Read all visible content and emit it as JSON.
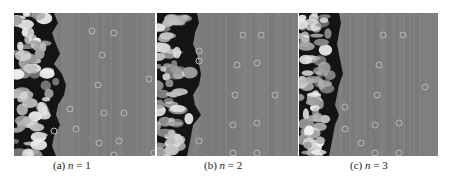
{
  "figure": {
    "panels": [
      {
        "id": "a",
        "label": "(a)",
        "var": "n",
        "eq": " = ",
        "value": "1",
        "boundary": [
          40,
          44,
          38,
          42,
          46,
          40,
          48,
          52,
          50,
          44,
          42,
          46,
          40,
          38,
          42
        ],
        "dots": [
          [
            78,
            18
          ],
          [
            100,
            20
          ],
          [
            88,
            42
          ],
          [
            135,
            66
          ],
          [
            84,
            72
          ],
          [
            56,
            96
          ],
          [
            90,
            100
          ],
          [
            110,
            100
          ],
          [
            62,
            116
          ],
          [
            85,
            130
          ],
          [
            105,
            128
          ],
          [
            140,
            140
          ],
          [
            100,
            142
          ],
          [
            40,
            118
          ]
        ]
      },
      {
        "id": "b",
        "label": "(b)",
        "var": "n",
        "eq": " = ",
        "value": "2",
        "boundary": [
          40,
          42,
          38,
          36,
          40,
          42,
          44,
          42,
          36,
          38,
          44,
          36,
          34,
          32,
          30
        ],
        "dots": [
          [
            86,
            22
          ],
          [
            104,
            22
          ],
          [
            80,
            52
          ],
          [
            100,
            50
          ],
          [
            78,
            82
          ],
          [
            118,
            82
          ],
          [
            76,
            112
          ],
          [
            100,
            110
          ],
          [
            42,
            128
          ],
          [
            76,
            140
          ],
          [
            100,
            140
          ],
          [
            50,
            146
          ],
          [
            42,
            38
          ],
          [
            42,
            48
          ]
        ]
      },
      {
        "id": "c",
        "label": "(c)",
        "var": "n",
        "eq": " = ",
        "value": "3",
        "boundary": [
          40,
          42,
          40,
          38,
          40,
          42,
          44,
          40,
          38,
          36,
          40,
          36,
          34,
          32,
          30
        ],
        "dots": [
          [
            84,
            22
          ],
          [
            104,
            22
          ],
          [
            80,
            52
          ],
          [
            126,
            74
          ],
          [
            78,
            82
          ],
          [
            46,
            94
          ],
          [
            76,
            112
          ],
          [
            100,
            110
          ],
          [
            62,
            130
          ],
          [
            76,
            140
          ],
          [
            100,
            140
          ],
          [
            140,
            146
          ],
          [
            46,
            116
          ]
        ]
      }
    ],
    "colors": {
      "background": "#7e7e7e",
      "dark": "#141414",
      "light": "#e8e8e8",
      "dot": "#b8b8b8"
    }
  }
}
